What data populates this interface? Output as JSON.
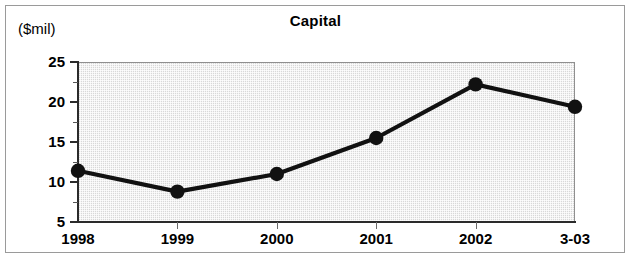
{
  "figure": {
    "title": "Capital",
    "y_axis_caption": "($mil)",
    "frame_color": "#9a9a9a",
    "plot_fill_color": "#d8d8d8",
    "series_color": "#111111"
  },
  "chart_data": {
    "type": "line",
    "title": "Capital",
    "xlabel": "",
    "ylabel": "($mil)",
    "categories": [
      "1998",
      "1999",
      "2000",
      "2001",
      "2002",
      "3-03"
    ],
    "values": [
      11.4,
      8.8,
      11.0,
      15.5,
      22.2,
      19.4
    ],
    "series": [
      {
        "name": "Capital",
        "values": [
          11.4,
          8.8,
          11.0,
          15.5,
          22.2,
          19.4
        ]
      }
    ],
    "ylim": [
      5,
      25
    ],
    "ytick_labels": [
      "5",
      "10",
      "15",
      "20",
      "25"
    ],
    "ytick_values": [
      5,
      10,
      15,
      20,
      25
    ],
    "yminor_tick_values": [
      7.5,
      12.5,
      17.5,
      22.5
    ],
    "xtick_labels": [
      "1998",
      "1999",
      "2000",
      "2001",
      "2002",
      "3-03"
    ],
    "grid": false,
    "legend": "none",
    "markers": "filled-circle"
  }
}
